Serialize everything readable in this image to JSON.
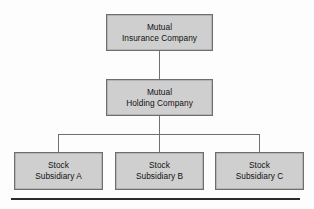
{
  "diagram": {
    "type": "organizational-chart",
    "title": "",
    "colors": {
      "background": "#fdfdfd",
      "node_fill": "#cfcfcf",
      "node_border": "#6e6e6e",
      "connector": "#6f6f6f",
      "rule": "#2b2b2b",
      "text": "#111111"
    },
    "nodes": {
      "mutual_insurance": {
        "line1": "Mutual",
        "line2": "Insurance Company",
        "level": 1
      },
      "mutual_holding": {
        "line1": "Mutual",
        "line2": "Holding Company",
        "level": 2
      },
      "subsidiary_a": {
        "line1": "Stock",
        "line2": "Subsidiary A",
        "level": 3
      },
      "subsidiary_b": {
        "line1": "Stock",
        "line2": "Subsidiary B",
        "level": 3
      },
      "subsidiary_c": {
        "line1": "Stock",
        "line2": "Subsidiary C",
        "level": 3
      }
    },
    "edges": [
      {
        "from": "mutual_insurance",
        "to": "mutual_holding"
      },
      {
        "from": "mutual_holding",
        "to": "subsidiary_a"
      },
      {
        "from": "mutual_holding",
        "to": "subsidiary_b"
      },
      {
        "from": "mutual_holding",
        "to": "subsidiary_c"
      }
    ]
  }
}
